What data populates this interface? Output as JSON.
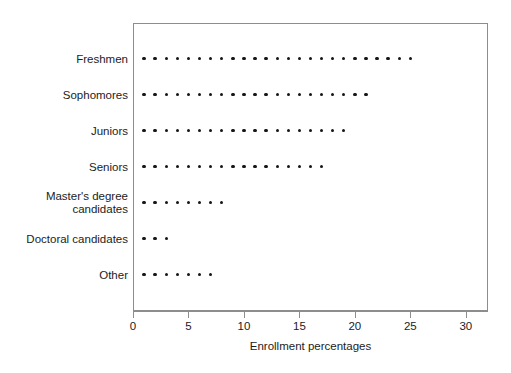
{
  "chart_data": {
    "type": "dot",
    "title": "",
    "subtitle": "",
    "xlabel": "Enrollment percentages",
    "ylabel": "",
    "categories": [
      "Freshmen",
      "Sophomores",
      "Juniors",
      "Seniors",
      "Master's degree\ncandidates",
      "Doctoral candidates",
      "Other"
    ],
    "values": [
      25,
      21,
      19,
      17,
      8,
      3,
      7
    ],
    "xlim": [
      0,
      32
    ],
    "xticks": [
      0,
      5,
      10,
      15,
      20,
      25,
      30
    ],
    "xticklabels": [
      "0",
      "5",
      "10",
      "15",
      "20",
      "25",
      "30"
    ],
    "grid": false,
    "legend": false,
    "legend_position": "none",
    "dot_unit": 1,
    "dot_start": 1,
    "marker_color": "#151515",
    "frame_color": "#8d8d8d",
    "background_color": "#ffffff",
    "note": "Each dot represents one percentage point; rows begin at x=1."
  }
}
